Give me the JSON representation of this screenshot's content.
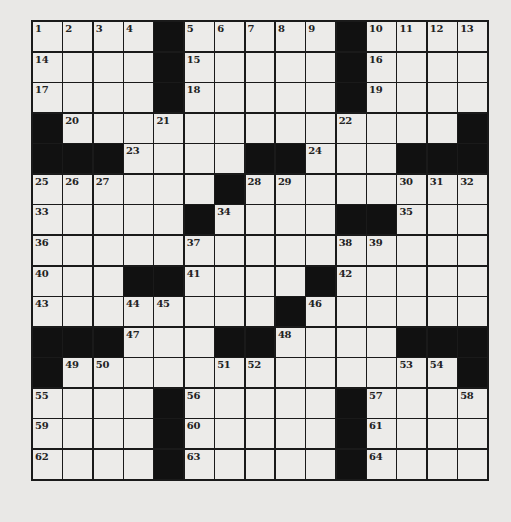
{
  "puzzle": {
    "rows": 15,
    "cols": 15,
    "colors": {
      "background": "#e9e8e6",
      "cell": "#ecebe9",
      "black": "#111111",
      "line": "#1a1a1a"
    },
    "grid": [
      [
        "1",
        "2",
        "3",
        "4",
        "#",
        "5",
        "6",
        "7",
        "8",
        "9",
        "#",
        "10",
        "11",
        "12",
        "13"
      ],
      [
        "14",
        "",
        "",
        "",
        "#",
        "15",
        "",
        "",
        "",
        "",
        "#",
        "16",
        "",
        "",
        ""
      ],
      [
        "17",
        "",
        "",
        "",
        "#",
        "18",
        "",
        "",
        "",
        "",
        "#",
        "19",
        "",
        "",
        ""
      ],
      [
        "#",
        "20",
        "",
        "",
        "21",
        "",
        "",
        "",
        "",
        "",
        "22",
        "",
        "",
        "",
        "#"
      ],
      [
        "#",
        "#",
        "#",
        "23",
        "",
        "",
        "",
        "#",
        "#",
        "24",
        "",
        "",
        "#",
        "#",
        "#"
      ],
      [
        "25",
        "26",
        "27",
        "",
        "",
        "",
        "#",
        "28",
        "29",
        "",
        "",
        "",
        "30",
        "31",
        "32"
      ],
      [
        "33",
        "",
        "",
        "",
        "",
        "#",
        "34",
        "",
        "",
        "",
        "#",
        "#",
        "35",
        "",
        ""
      ],
      [
        "36",
        "",
        "",
        "",
        "",
        "37",
        "",
        "",
        "",
        "",
        "38",
        "39",
        "",
        "",
        ""
      ],
      [
        "40",
        "",
        "",
        "#",
        "#",
        "41",
        "",
        "",
        "",
        "#",
        "42",
        "",
        "",
        "",
        ""
      ],
      [
        "43",
        "",
        "",
        "44",
        "45",
        "",
        "",
        "",
        "#",
        "46",
        "",
        "",
        "",
        "",
        ""
      ],
      [
        "#",
        "#",
        "#",
        "47",
        "",
        "",
        "#",
        "#",
        "48",
        "",
        "",
        "",
        "#",
        "#",
        "#"
      ],
      [
        "#",
        "49",
        "50",
        "",
        "",
        "",
        "51",
        "52",
        "",
        "",
        "",
        "",
        "53",
        "54",
        "#"
      ],
      [
        "55",
        "",
        "",
        "",
        "#",
        "56",
        "",
        "",
        "",
        "",
        "#",
        "57",
        "",
        "",
        "58"
      ],
      [
        "59",
        "",
        "",
        "",
        "#",
        "60",
        "",
        "",
        "",
        "",
        "#",
        "61",
        "",
        "",
        ""
      ],
      [
        "62",
        "",
        "",
        "",
        "#",
        "63",
        "",
        "",
        "",
        "",
        "#",
        "64",
        "",
        "",
        ""
      ]
    ]
  }
}
